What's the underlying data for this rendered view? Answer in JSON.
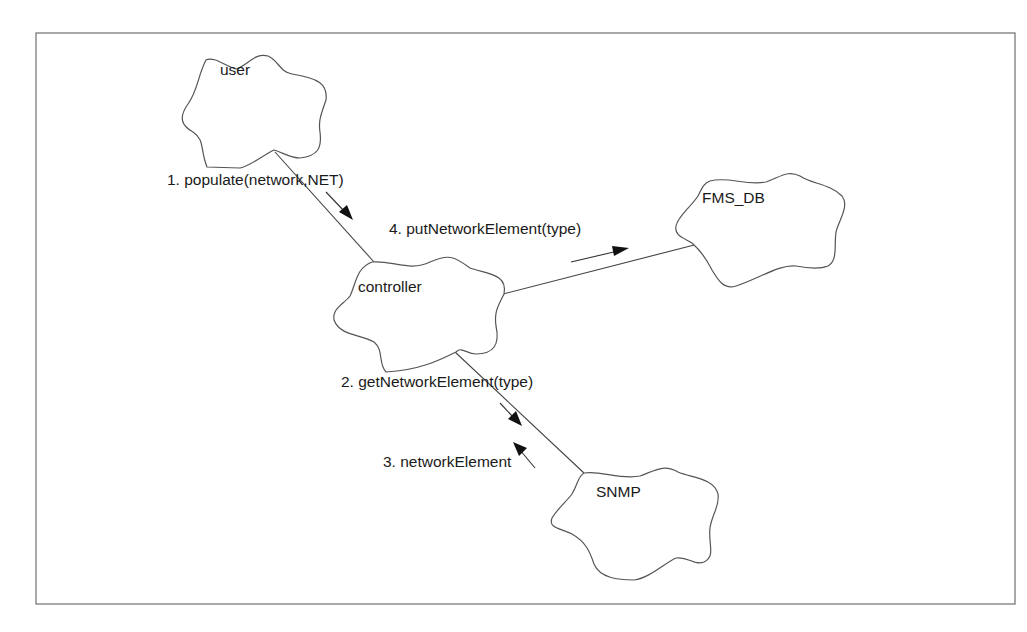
{
  "diagram": {
    "type": "collaboration-diagram",
    "objects": [
      {
        "id": "user",
        "label": "user"
      },
      {
        "id": "controller",
        "label": "controller"
      },
      {
        "id": "fms_db",
        "label": "FMS_DB"
      },
      {
        "id": "snmp",
        "label": "SNMP"
      }
    ],
    "links": [
      {
        "from": "user",
        "to": "controller"
      },
      {
        "from": "controller",
        "to": "fms_db"
      },
      {
        "from": "controller",
        "to": "snmp"
      }
    ],
    "messages": [
      {
        "seq": 1,
        "label": "1. populate(network,NET)",
        "from": "user",
        "to": "controller"
      },
      {
        "seq": 2,
        "label": "2. getNetworkElement(type)",
        "from": "controller",
        "to": "snmp"
      },
      {
        "seq": 3,
        "label": "3. networkElement",
        "from": "snmp",
        "to": "controller"
      },
      {
        "seq": 4,
        "label": "4. putNetworkElement(type)",
        "from": "controller",
        "to": "fms_db"
      }
    ]
  },
  "colors": {
    "background": "#ffffff",
    "frame": "#7a7a7a",
    "cloud_stroke": "#555555",
    "line": "#444444",
    "arrow": "#111111",
    "text": "#1a1a1a"
  }
}
